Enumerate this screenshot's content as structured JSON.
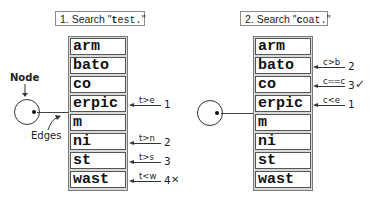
{
  "panels": [
    {
      "title_prefix": "1. Search \"",
      "title_key_char": "t",
      "title_rest": "est.",
      "title_suffix": "\"",
      "cells": [
        "arm",
        "bato",
        "co",
        "erpic",
        "m",
        "ni",
        "st",
        "wast"
      ],
      "annotations": [
        {
          "row": 3,
          "comparison": "t>e",
          "step": "1",
          "mark": ""
        },
        {
          "row": 5,
          "comparison": "t>n",
          "step": "2",
          "mark": ""
        },
        {
          "row": 6,
          "comparison": "t>s",
          "step": "3",
          "mark": ""
        },
        {
          "row": 7,
          "comparison": "t<w",
          "step": "4",
          "mark": "✕"
        }
      ]
    },
    {
      "title_prefix": "2. Search \"",
      "title_key_char": "c",
      "title_rest": "oat.",
      "title_suffix": "\"",
      "cells": [
        "arm",
        "bato",
        "co",
        "erpic",
        "m",
        "ni",
        "st",
        "wast"
      ],
      "annotations": [
        {
          "row": 1,
          "comparison": "c>b",
          "step": "2",
          "mark": ""
        },
        {
          "row": 2,
          "comparison": "c==c",
          "step": "3",
          "mark": "✓"
        },
        {
          "row": 3,
          "comparison": "c<e",
          "step": "1",
          "mark": ""
        }
      ]
    }
  ],
  "labels": {
    "node": "Node",
    "edges": "Edges"
  }
}
